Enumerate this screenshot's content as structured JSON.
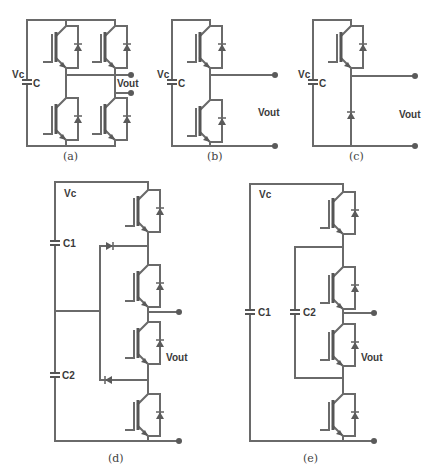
{
  "figures": {
    "a": {
      "caption": "(a)",
      "labels": {
        "vc": "Vc",
        "cap": "C",
        "vout": "Vout"
      },
      "description": "Full-bridge (H-bridge) with 4 IGBTs and anti-parallel diodes"
    },
    "b": {
      "caption": "(b)",
      "labels": {
        "vc": "Vc",
        "cap": "C",
        "vout": "Vout"
      },
      "description": "Half-bridge with 2 IGBTs and anti-parallel diodes"
    },
    "c": {
      "caption": "(c)",
      "labels": {
        "vc": "Vc",
        "cap": "C",
        "vout": "Vout"
      },
      "description": "Chopper cell: 1 IGBT with anti-parallel diode and 1 freewheeling diode"
    },
    "d": {
      "caption": "(d)",
      "labels": {
        "vc": "Vc",
        "cap1": "C1",
        "cap2": "C2",
        "vout": "Vout"
      },
      "description": "Neutral-point clamped cell with 4 IGBTs, 2 clamping diodes, split capacitors C1/C2"
    },
    "e": {
      "caption": "(e)",
      "labels": {
        "vc": "Vc",
        "cap1": "C1",
        "cap2": "C2",
        "vout": "Vout"
      },
      "description": "Flying-capacitor cell with 4 IGBTs, capacitors C1 and C2"
    }
  },
  "colors": {
    "wire": "#6a6a6a",
    "text": "#3a3a3a",
    "background": "#ffffff"
  }
}
